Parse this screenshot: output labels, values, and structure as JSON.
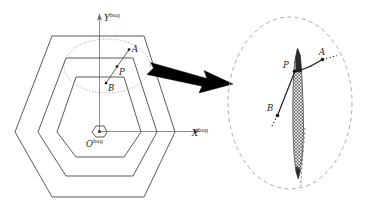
{
  "figure": {
    "background": "#ffffff",
    "line_color": "#3c3c3c",
    "axis_color": "#555555",
    "dash_color": "#9a9a9a",
    "arrow_color": "#000000",
    "hatch_color": "#4a4a4a"
  },
  "left_view": {
    "name": "hexagonal-cell-diagram",
    "hexagon_count": 4,
    "axes": {
      "x_axis": {
        "label_base": "X",
        "label_sup": "bug",
        "direction": "right"
      },
      "y_axis": {
        "label_base": "Y",
        "label_sup": "bug",
        "direction": "up"
      },
      "origin": {
        "label_base": "O",
        "label_sup": "bug",
        "marker": "hexagon-dot"
      }
    },
    "points": [
      {
        "id": "A",
        "label": "A",
        "role": "upper-point"
      },
      {
        "id": "P",
        "label": "P",
        "role": "mid-point"
      },
      {
        "id": "B",
        "label": "B",
        "role": "lower-point"
      }
    ],
    "highlight_region": {
      "shape": "ellipse",
      "style": "dotted"
    }
  },
  "connector": {
    "name": "magnify-arrow",
    "style": "solid-block-arrow",
    "direction": "left-to-right"
  },
  "detail_view": {
    "name": "magnified-wall-detail",
    "boundary": {
      "shape": "ellipse",
      "style": "dashed"
    },
    "region": {
      "shape": "tapered-sliver",
      "fill": "cross-hatch"
    },
    "points": [
      {
        "id": "A",
        "label": "A",
        "role": "upper-point"
      },
      {
        "id": "P",
        "label": "P",
        "role": "contact-point"
      },
      {
        "id": "B",
        "label": "B",
        "role": "lower-point"
      }
    ]
  }
}
